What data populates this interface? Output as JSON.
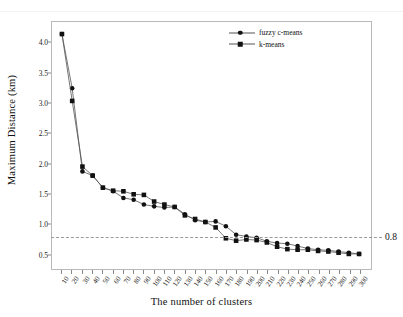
{
  "figure": {
    "top_ghost_text": "",
    "threshold_label": "0.8"
  },
  "chart_data": {
    "type": "line",
    "title": "",
    "xlabel": "The number of clusters",
    "ylabel": "Maximum Distance (km)",
    "categories": [
      10,
      20,
      30,
      40,
      50,
      60,
      70,
      80,
      90,
      100,
      110,
      120,
      130,
      140,
      150,
      160,
      170,
      180,
      190,
      200,
      210,
      220,
      230,
      240,
      250,
      260,
      270,
      280,
      290,
      300
    ],
    "xtick_labels": [
      "10",
      "20",
      "30",
      "40",
      "50",
      "60",
      "70",
      "80",
      "90",
      "100",
      "110",
      "120",
      "130",
      "140",
      "150",
      "160",
      "170",
      "180",
      "190",
      "200",
      "210",
      "220",
      "230",
      "240",
      "250",
      "260",
      "270",
      "280",
      "290",
      "300"
    ],
    "ytick_labels": [
      "0.5",
      "1.0",
      "1.5",
      "2.0",
      "2.5",
      "3.0",
      "3.5",
      "4.0"
    ],
    "ytick_values": [
      0.5,
      1.0,
      1.5,
      2.0,
      2.5,
      3.0,
      3.5,
      4.0
    ],
    "ylim": [
      0.25,
      4.35
    ],
    "grid": false,
    "legend_position": "top-right-inside",
    "series": [
      {
        "name": "fuzzy c-means",
        "marker": "circle",
        "color": "#111111",
        "values": [
          4.15,
          3.25,
          1.87,
          1.8,
          1.6,
          1.54,
          1.43,
          1.4,
          1.32,
          1.29,
          1.27,
          1.28,
          1.16,
          1.06,
          1.03,
          1.04,
          0.96,
          0.82,
          0.79,
          0.77,
          0.71,
          0.68,
          0.67,
          0.63,
          0.59,
          0.57,
          0.56,
          0.54,
          0.52,
          0.5
        ]
      },
      {
        "name": "k-means",
        "marker": "square",
        "color": "#111111",
        "values": [
          4.15,
          3.04,
          1.95,
          1.8,
          1.6,
          1.55,
          1.54,
          1.49,
          1.48,
          1.37,
          1.32,
          1.28,
          1.14,
          1.08,
          1.03,
          0.94,
          0.76,
          0.72,
          0.74,
          0.73,
          0.69,
          0.62,
          0.58,
          0.57,
          0.57,
          0.55,
          0.54,
          0.52,
          0.5,
          0.5
        ]
      }
    ],
    "annotations": [
      {
        "type": "hline",
        "value": 0.8,
        "label": "0.8",
        "style": "dashed",
        "color": "#9a9a9a"
      }
    ]
  }
}
